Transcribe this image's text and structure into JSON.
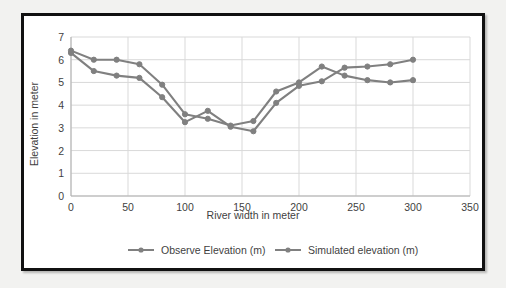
{
  "chart_data": {
    "type": "line",
    "title": "",
    "xlabel": "River width in meter",
    "ylabel": "Elevation in meter",
    "xlim": [
      0,
      350
    ],
    "ylim": [
      0,
      7
    ],
    "xticks": [
      "0",
      "50",
      "100",
      "150",
      "200",
      "250",
      "300",
      "350"
    ],
    "yticks": [
      "0",
      "1",
      "2",
      "3",
      "4",
      "5",
      "6",
      "7"
    ],
    "grid": true,
    "legend_position": "bottom",
    "x": [
      0,
      20,
      40,
      60,
      80,
      100,
      120,
      140,
      160,
      180,
      200,
      220,
      240,
      260,
      280,
      300
    ],
    "series": [
      {
        "name": "Observe Elevation (m)",
        "color": "#808080",
        "values": [
          6.4,
          6.0,
          6.0,
          5.8,
          4.9,
          3.6,
          3.4,
          3.1,
          3.3,
          4.6,
          5.0,
          5.7,
          5.3,
          5.1,
          5.0,
          5.1
        ]
      },
      {
        "name": "Simulated elevation (m)",
        "color": "#808080",
        "values": [
          6.3,
          5.5,
          5.3,
          5.2,
          4.35,
          3.25,
          3.75,
          3.05,
          2.85,
          4.1,
          4.85,
          5.05,
          5.65,
          5.7,
          5.8,
          6.0
        ]
      }
    ]
  },
  "legend": {
    "items": [
      {
        "label": "Observe Elevation (m)"
      },
      {
        "label": "Simulated elevation (m)"
      }
    ]
  },
  "axes": {
    "x_title": "River width in meter",
    "y_title": "Elevation in meter"
  }
}
